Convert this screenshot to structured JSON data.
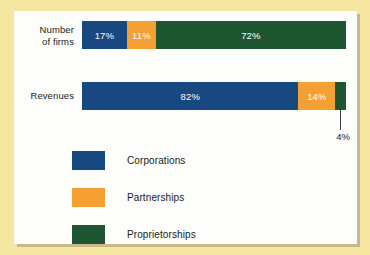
{
  "colors": {
    "page_background": "#f5e6a0",
    "panel_background": "#fdfdfb",
    "corporations": "#17487f",
    "partnerships": "#f4a032",
    "proprietorships": "#1e5631",
    "text": "#1b1b1b",
    "value_label": "#ffffff"
  },
  "rows": [
    {
      "label": "Number\nof firms",
      "label_line1": "Number",
      "label_line2": "of firms",
      "segments": [
        {
          "name": "Corporations",
          "value": 17,
          "label": "17%",
          "color": "#17487f",
          "label_visible": true
        },
        {
          "name": "Partnerships",
          "value": 11,
          "label": "11%",
          "color": "#f4a032",
          "label_visible": true
        },
        {
          "name": "Proprietorships",
          "value": 72,
          "label": "72%",
          "color": "#1e5631",
          "label_visible": true
        }
      ]
    },
    {
      "label": "Revenues",
      "label_line1": "Revenues",
      "label_line2": "",
      "segments": [
        {
          "name": "Corporations",
          "value": 82,
          "label": "82%",
          "color": "#17487f",
          "label_visible": true
        },
        {
          "name": "Partnerships",
          "value": 14,
          "label": "14%",
          "color": "#f4a032",
          "label_visible": true
        },
        {
          "name": "Proprietorships",
          "value": 4,
          "label": "4%",
          "color": "#1e5631",
          "label_visible": false
        }
      ]
    }
  ],
  "callout": {
    "text": "4%"
  },
  "legend": {
    "items": [
      {
        "label": "Corporations",
        "color": "#17487f"
      },
      {
        "label": "Partnerships",
        "color": "#f4a032"
      },
      {
        "label": "Proprietorships",
        "color": "#1e5631"
      }
    ]
  },
  "chart_data": {
    "type": "bar",
    "orientation": "horizontal",
    "stacked": true,
    "normalized_percent": true,
    "title": "",
    "subtitle": "",
    "xlabel": "",
    "ylabel": "",
    "xlim": [
      0,
      100
    ],
    "grid": false,
    "legend_position": "bottom-left",
    "categories": [
      "Number of firms",
      "Revenues"
    ],
    "series": [
      {
        "name": "Corporations",
        "values": [
          17,
          82
        ],
        "color": "#17487f"
      },
      {
        "name": "Partnerships",
        "values": [
          11,
          14
        ],
        "color": "#f4a032"
      },
      {
        "name": "Proprietorships",
        "values": [
          72,
          4
        ],
        "color": "#1e5631"
      }
    ],
    "data_labels": [
      [
        "17%",
        "11%",
        "72%"
      ],
      [
        "82%",
        "14%",
        "4%"
      ]
    ],
    "annotations": [
      {
        "text": "4%",
        "refers_to": {
          "category": "Revenues",
          "series": "Proprietorships"
        },
        "style": "leader-line"
      }
    ]
  }
}
